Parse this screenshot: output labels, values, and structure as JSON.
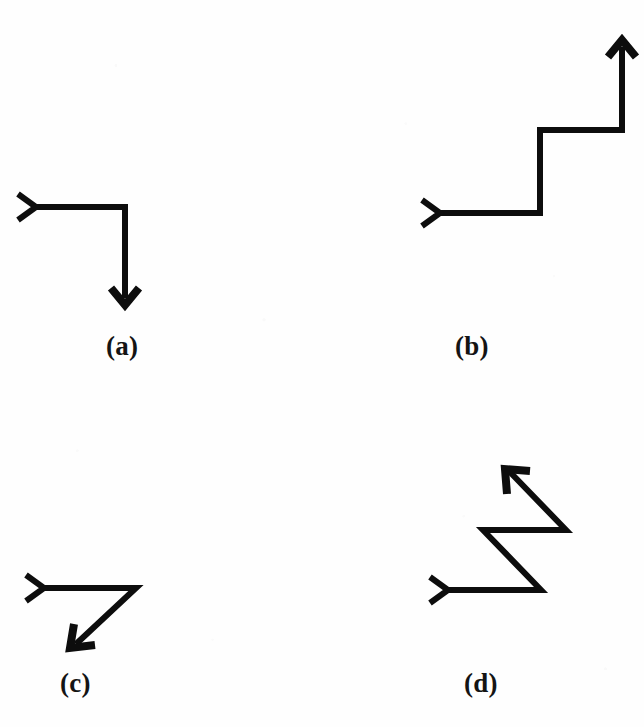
{
  "figure": {
    "background_color": "#fefefe",
    "stroke_color": "#0d0d0d",
    "stroke_width": 6,
    "label_color": "#141414",
    "panels": [
      {
        "id": "a",
        "label": "(a)",
        "description": "right-angle path: rightward segment then downward segment ending in arrowhead",
        "tail_marker": "chevron-right",
        "head_marker": "arrow-down",
        "segments": 2,
        "path": "M 36 57 L 125 57 L 125 148",
        "tail": "M 18 44 L 36 57 L 18 70",
        "head": "M 111 138 L 125 155 L 139 138",
        "viewbox": "0 0 322 180"
      },
      {
        "id": "b",
        "label": "(b)",
        "description": "staircase path: right, up, right, up ending in arrowhead",
        "tail_marker": "chevron-right",
        "head_marker": "arrow-up",
        "segments": 4,
        "path": "M 40 193 L 140 193 L 140 110 L 222 110 L 222 27",
        "tail": "M 22 180 L 40 193 L 22 206",
        "head": "M 208 37 L 222 20 L 236 37",
        "viewbox": "0 0 244 220"
      },
      {
        "id": "c",
        "label": "(c)",
        "description": "rightward segment then diagonal down-left segment ending in arrowhead",
        "tail_marker": "chevron-right",
        "head_marker": "arrow-down-left",
        "segments": 2,
        "path": "M 44 43 L 136 43 L 76 99",
        "tail": "M 26 30 L 44 43 L 26 56",
        "head": "M 74 79 L 70 103 L 95 100",
        "viewbox": "0 0 250 120"
      },
      {
        "id": "d",
        "label": "(d)",
        "description": "zigzag path: right, diagonal up-left, right, diagonal up-left ending in arrowhead",
        "tail_marker": "chevron-right",
        "head_marker": "arrow-up-left",
        "segments": 4,
        "path": "M 48 140 L 141 140 L 83 80 L 166 80 L 109 21",
        "tail": "M 30 127 L 48 140 L 30 153",
        "head": "M 107 44 L 105 19 L 130 21",
        "viewbox": "0 0 244 165"
      }
    ]
  }
}
